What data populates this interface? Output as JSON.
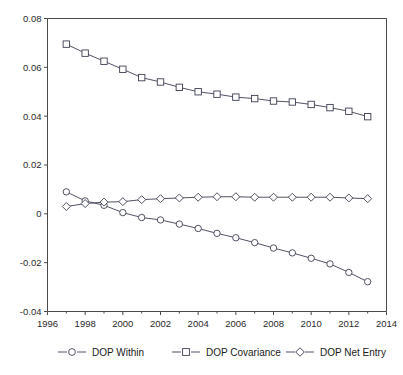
{
  "chart_data": {
    "type": "line",
    "title": "",
    "xlabel": "",
    "ylabel": "",
    "xlim": [
      1996,
      2014
    ],
    "ylim": [
      -0.04,
      0.08
    ],
    "grid": false,
    "legend_position": "bottom",
    "x": [
      1997,
      1998,
      1999,
      2000,
      2001,
      2002,
      2003,
      2004,
      2005,
      2006,
      2007,
      2008,
      2009,
      2010,
      2011,
      2012,
      2013
    ],
    "xticks": [
      "1996",
      "1998",
      "2000",
      "2002",
      "2004",
      "2006",
      "2008",
      "2010",
      "2012",
      "2014"
    ],
    "xtick_values": [
      1996,
      1998,
      2000,
      2002,
      2004,
      2006,
      2008,
      2010,
      2012,
      2014
    ],
    "yticks": [
      "0.08",
      "0.06",
      "0.04",
      "0.02",
      "0",
      "-0.02",
      "-0.04"
    ],
    "ytick_values": [
      0.08,
      0.06,
      0.04,
      0.02,
      0,
      -0.02,
      -0.04
    ],
    "series": [
      {
        "name": "DOP Within",
        "marker": "circle",
        "values": [
          0.009,
          0.0053,
          0.0035,
          0.0005,
          -0.0015,
          -0.0025,
          -0.0042,
          -0.006,
          -0.008,
          -0.0098,
          -0.0118,
          -0.014,
          -0.016,
          -0.0182,
          -0.0205,
          -0.024,
          -0.0278
        ]
      },
      {
        "name": "DOP Covariance",
        "marker": "square",
        "values": [
          0.0695,
          0.0658,
          0.0625,
          0.0592,
          0.0558,
          0.054,
          0.0518,
          0.05,
          0.049,
          0.0478,
          0.0472,
          0.0462,
          0.0458,
          0.0448,
          0.0435,
          0.042,
          0.0398
        ]
      },
      {
        "name": "DOP Net Entry",
        "marker": "diamond",
        "values": [
          0.003,
          0.0042,
          0.0048,
          0.005,
          0.0058,
          0.0062,
          0.0065,
          0.0068,
          0.007,
          0.007,
          0.0068,
          0.0068,
          0.0068,
          0.0068,
          0.0068,
          0.0065,
          0.0062
        ]
      }
    ]
  },
  "legend": {
    "items": [
      {
        "label": "DOP Within",
        "marker": "circle"
      },
      {
        "label": "DOP Covariance",
        "marker": "square"
      },
      {
        "label": "DOP Net Entry",
        "marker": "diamond"
      }
    ]
  },
  "colors": {
    "line": "#3d3f52",
    "axis": "#4a4a4a",
    "marker_fill": "#ffffff",
    "background": "#ffffff"
  }
}
